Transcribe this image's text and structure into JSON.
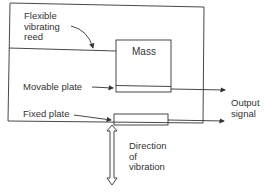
{
  "labels": {
    "reed": [
      "Flexible",
      "vibrating",
      "reed"
    ],
    "mass": "Mass",
    "movable_plate": "Movable plate",
    "fixed_plate": "Fixed plate",
    "output_signal": [
      "Output",
      "signal"
    ],
    "direction": [
      "Direction",
      "of",
      "vibration"
    ]
  },
  "colors": {
    "stroke": "#333333",
    "background": "#ffffff"
  }
}
